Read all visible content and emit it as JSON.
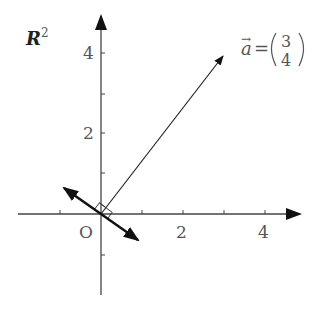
{
  "diagram": {
    "space_label": "R",
    "space_sup": "2",
    "origin_label": "O",
    "x_ticks": [
      "2",
      "4"
    ],
    "y_ticks": [
      "2",
      "4"
    ],
    "vector": {
      "name": "a",
      "arrow": "→",
      "equals": "=",
      "components": [
        "3",
        "4"
      ],
      "tip": [
        3,
        4
      ]
    },
    "normal_vector": {
      "direction": [
        4,
        -3
      ],
      "note": "double-headed arrow perpendicular to a through origin"
    },
    "right_angle_marker": true
  }
}
